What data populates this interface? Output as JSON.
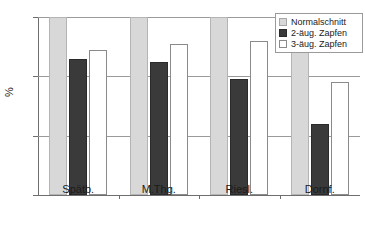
{
  "chart_data": {
    "type": "bar",
    "title": "",
    "xlabel": "",
    "ylabel": "%",
    "ylim": [
      40,
      100
    ],
    "yticks": [
      40,
      60,
      80,
      100
    ],
    "grid": true,
    "legend_position": "top-right",
    "categories": [
      "Spätb.",
      "M.Thg.",
      "Riesl.",
      "Dornf."
    ],
    "series": [
      {
        "name": "Normalschnitt",
        "values": [
          100,
          100,
          100,
          100
        ]
      },
      {
        "name": "2-äug. Zapfen",
        "values": [
          86,
          85,
          79,
          64
        ]
      },
      {
        "name": "3-äug. Zapfen",
        "values": [
          89,
          91,
          92,
          78
        ]
      }
    ],
    "colors": {
      "normalschnitt": "#d8d8d8",
      "zapfen2": "#3a3a3a",
      "zapfen3": "#ffffff",
      "axis": "#6e6e6e",
      "grid": "#9a9a9a"
    }
  }
}
